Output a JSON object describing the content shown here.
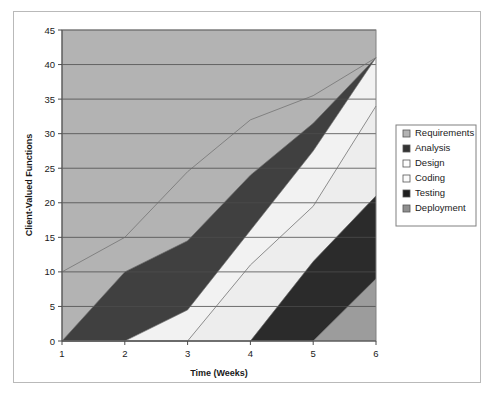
{
  "chart_data": {
    "type": "area",
    "title": "",
    "xlabel": "Time (Weeks)",
    "ylabel": "Client-Valued Functions",
    "x": [
      1,
      2,
      3,
      4,
      5,
      6
    ],
    "categories": [
      "1",
      "2",
      "3",
      "4",
      "5",
      "6"
    ],
    "xlim": [
      1,
      6
    ],
    "ylim": [
      0,
      45
    ],
    "ytick_step": 5,
    "yticks": [
      "0",
      "5",
      "10",
      "15",
      "20",
      "25",
      "30",
      "35",
      "40",
      "45"
    ],
    "grid": "horizontal",
    "stacked": true,
    "legend_position": "right",
    "series": [
      {
        "name": "Requirements",
        "color": "#b3b3b3",
        "values": [
          10,
          5,
          2,
          0,
          0,
          0
        ]
      },
      {
        "name": "Analysis",
        "color": "#404040",
        "values": [
          0,
          10,
          10,
          8,
          4,
          0
        ]
      },
      {
        "name": "Design",
        "color": "#f2f2f2",
        "values": [
          0,
          0,
          0,
          5,
          8,
          7
        ]
      },
      {
        "name": "Coding",
        "color": "#ededed",
        "values": [
          0,
          0,
          0,
          11,
          13,
          13
        ]
      },
      {
        "name": "Testing",
        "color": "#2b2b2b",
        "values": [
          0,
          0,
          0,
          0,
          8,
          12
        ]
      },
      {
        "name": "Deployment",
        "color": "#9c9c9c",
        "values": [
          0,
          0,
          0,
          0,
          0,
          9
        ]
      }
    ],
    "cumulative_tops": {
      "Requirements": [
        10,
        15,
        24.5,
        32,
        35.5,
        41
      ],
      "Analysis": [
        0,
        10,
        14.5,
        24,
        31.5,
        41
      ],
      "Design": [
        0,
        0,
        4.5,
        16,
        27.5,
        41
      ],
      "Coding": [
        0,
        0,
        0,
        11,
        19.5,
        34
      ],
      "Testing": [
        0,
        0,
        0,
        0,
        11.5,
        21
      ],
      "Deployment": [
        0,
        0,
        0,
        0,
        0,
        9
      ]
    },
    "legend": [
      {
        "label": "Requirements",
        "swatch": "#b3b3b3"
      },
      {
        "label": "Analysis",
        "swatch": "#333333"
      },
      {
        "label": "Design",
        "swatch": "#fdfdfd"
      },
      {
        "label": "Coding",
        "swatch": "#fafafa"
      },
      {
        "label": "Testing",
        "swatch": "#1f1f1f"
      },
      {
        "label": "Deployment",
        "swatch": "#8f8f8f"
      }
    ]
  },
  "style": {
    "plot_border": "#808080",
    "gridline": "#4d4d4d",
    "frame_border": "#b9b9b9",
    "text": "#1a1a1a"
  }
}
